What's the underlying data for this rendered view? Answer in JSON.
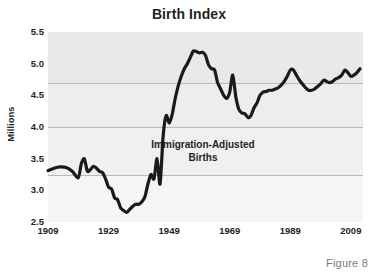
{
  "chart_data": {
    "type": "line",
    "title": "Birth Index",
    "xlabel": "",
    "ylabel": "Millions",
    "xlim": [
      1909,
      2013
    ],
    "ylim": [
      2.5,
      5.5
    ],
    "grid": true,
    "gridlines_y": [
      3.25,
      4.0,
      4.7
    ],
    "legend": "none",
    "xticks": [
      1909,
      1929,
      1949,
      1969,
      1989,
      2009
    ],
    "xticklabels": [
      "1909",
      "1929",
      "1949",
      "1969",
      "1989",
      "2009"
    ],
    "yticks": [
      2.5,
      3.0,
      3.5,
      4.0,
      4.5,
      5.0,
      5.5
    ],
    "yticklabels": [
      "2.5",
      "3.0",
      "3.5",
      "4.0",
      "4.5",
      "5.0",
      "5.5"
    ],
    "annotations": [
      {
        "text_line1": "Immigration-Adjusted",
        "text_line2": "Births",
        "x": 1972,
        "y": 3.66
      }
    ],
    "caption": "Figure 8",
    "series": [
      {
        "name": "Immigration-Adjusted Births",
        "color": "#1a1a1a",
        "x": [
          1909,
          1911,
          1913,
          1915,
          1917,
          1919,
          1920,
          1921,
          1922,
          1923,
          1924,
          1925,
          1926,
          1927,
          1928,
          1929,
          1930,
          1931,
          1932,
          1933,
          1934,
          1935,
          1936,
          1937,
          1938,
          1939,
          1940,
          1941,
          1942,
          1943,
          1944,
          1945,
          1946,
          1947,
          1948,
          1949,
          1950,
          1951,
          1952,
          1953,
          1954,
          1955,
          1956,
          1957,
          1958,
          1959,
          1960,
          1961,
          1962,
          1963,
          1964,
          1965,
          1966,
          1967,
          1968,
          1969,
          1970,
          1971,
          1972,
          1973,
          1974,
          1975,
          1976,
          1977,
          1978,
          1979,
          1980,
          1981,
          1982,
          1983,
          1984,
          1985,
          1986,
          1987,
          1988,
          1989,
          1990,
          1991,
          1992,
          1993,
          1994,
          1995,
          1996,
          1997,
          1998,
          1999,
          2000,
          2001,
          2002,
          2003,
          2004,
          2005,
          2006,
          2007,
          2008,
          2009,
          2010,
          2011,
          2012
        ],
        "y": [
          3.31,
          3.35,
          3.37,
          3.36,
          3.3,
          3.2,
          3.42,
          3.5,
          3.3,
          3.33,
          3.38,
          3.35,
          3.3,
          3.28,
          3.18,
          3.05,
          3.02,
          2.88,
          2.85,
          2.72,
          2.68,
          2.65,
          2.7,
          2.75,
          2.78,
          2.78,
          2.82,
          2.9,
          3.1,
          3.25,
          3.18,
          3.5,
          3.1,
          3.85,
          4.18,
          4.06,
          4.2,
          4.45,
          4.65,
          4.8,
          4.92,
          5.0,
          5.1,
          5.2,
          5.19,
          5.17,
          5.18,
          5.13,
          4.98,
          4.92,
          4.9,
          4.7,
          4.6,
          4.5,
          4.45,
          4.55,
          4.82,
          4.48,
          4.28,
          4.22,
          4.21,
          4.15,
          4.18,
          4.3,
          4.38,
          4.5,
          4.55,
          4.56,
          4.58,
          4.58,
          4.6,
          4.62,
          4.66,
          4.72,
          4.8,
          4.9,
          4.9,
          4.82,
          4.74,
          4.68,
          4.62,
          4.58,
          4.58,
          4.6,
          4.64,
          4.68,
          4.74,
          4.72,
          4.7,
          4.72,
          4.76,
          4.78,
          4.82,
          4.9,
          4.86,
          4.8,
          4.82,
          4.86,
          4.92
        ]
      }
    ]
  }
}
